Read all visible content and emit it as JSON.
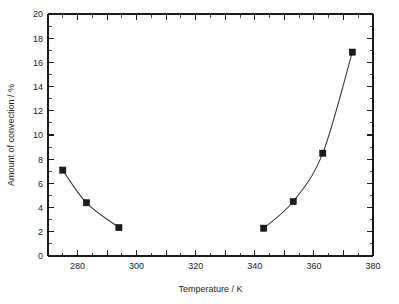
{
  "chart_data": {
    "type": "line",
    "title": "",
    "subtitle": "",
    "xlabel": "Temperature / K",
    "ylabel": "Amount of convection / %",
    "xlim": [
      270,
      380
    ],
    "ylim": [
      0,
      20
    ],
    "x_major_ticks": [
      270,
      280,
      290,
      300,
      310,
      320,
      330,
      340,
      350,
      360,
      370,
      380
    ],
    "x_tick_labels": [
      "",
      "280",
      "",
      "300",
      "",
      "320",
      "",
      "340",
      "",
      "360",
      "",
      "380"
    ],
    "y_major_ticks": [
      0,
      2,
      4,
      6,
      8,
      10,
      12,
      14,
      16,
      18,
      20
    ],
    "y_tick_labels": [
      "0",
      "2",
      "4",
      "6",
      "8",
      "10",
      "12",
      "14",
      "16",
      "18",
      "20"
    ],
    "x_minor_tick_interval": 5,
    "y_minor_tick_interval": 1,
    "grid": false,
    "legend": null,
    "legend_position": "none",
    "marker": "filled-square",
    "marker_color": "#1b1b1b",
    "line_color": "#3a3a3a",
    "background_color": "#ffffff",
    "axis_color": "#1a1a1a",
    "series": [
      {
        "name": "low-temperature branch",
        "x": [
          275,
          283,
          294
        ],
        "y": [
          7.1,
          4.4,
          2.35
        ]
      },
      {
        "name": "high-temperature branch",
        "x": [
          343,
          353,
          363,
          373
        ],
        "y": [
          2.3,
          4.5,
          8.5,
          16.85
        ]
      }
    ]
  },
  "figure": {
    "xlabel": "Temperature / K",
    "ylabel": "Amount of convection / %"
  }
}
